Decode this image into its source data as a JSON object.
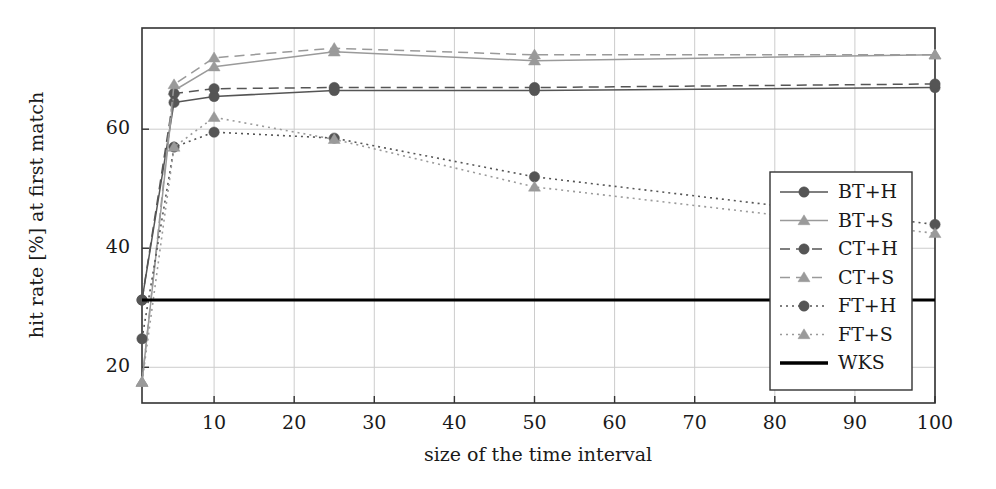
{
  "chart_data": {
    "type": "line",
    "title": "",
    "xlabel": "size of the time interval",
    "ylabel": "hit rate [%] at first match",
    "xlim": [
      1,
      100
    ],
    "ylim": [
      14,
      77
    ],
    "xticks": [
      10,
      20,
      30,
      40,
      50,
      60,
      70,
      80,
      90,
      100
    ],
    "yticks": [
      20,
      40,
      60
    ],
    "grid": true,
    "legend_position": "right-inside-bottom",
    "x": [
      1,
      5,
      10,
      25,
      50,
      100
    ],
    "series": [
      {
        "name": "BT+H",
        "marker": "circle",
        "line": "solid",
        "color": "#555555",
        "values": [
          31.3,
          64.5,
          65.5,
          66.5,
          66.5,
          67.0
        ]
      },
      {
        "name": "BT+S",
        "marker": "triangle",
        "line": "solid",
        "color": "#9a9a9a",
        "values": [
          17.5,
          66.5,
          70.5,
          73.0,
          71.5,
          72.5
        ]
      },
      {
        "name": "CT+H",
        "marker": "circle",
        "line": "dashed",
        "color": "#555555",
        "values": [
          31.3,
          66.0,
          66.8,
          67.0,
          67.0,
          67.6
        ]
      },
      {
        "name": "CT+S",
        "marker": "triangle",
        "line": "dashed",
        "color": "#9a9a9a",
        "values": [
          17.5,
          67.5,
          72.0,
          73.6,
          72.5,
          72.5
        ]
      },
      {
        "name": "FT+H",
        "marker": "circle",
        "line": "dotted",
        "color": "#555555",
        "values": [
          24.8,
          57.0,
          59.5,
          58.5,
          52.0,
          44.0
        ]
      },
      {
        "name": "FT+S",
        "marker": "triangle",
        "line": "dotted",
        "color": "#9a9a9a",
        "values": [
          17.5,
          57.0,
          62.0,
          58.3,
          50.3,
          42.5
        ]
      },
      {
        "name": "WKS",
        "marker": "none",
        "line": "thick-solid",
        "color": "#000000",
        "constant": 31.3,
        "values": [
          31.3,
          31.3,
          31.3,
          31.3,
          31.3,
          31.3
        ]
      }
    ]
  },
  "legend": {
    "items": [
      {
        "label": "BT+H"
      },
      {
        "label": "BT+S"
      },
      {
        "label": "CT+H"
      },
      {
        "label": "CT+S"
      },
      {
        "label": "FT+H"
      },
      {
        "label": "FT+S"
      },
      {
        "label": "WKS"
      }
    ]
  },
  "axes": {
    "ylabel": "hit rate [%] at first match",
    "xlabel": "size of the time interval",
    "ytick_labels": [
      "20",
      "40",
      "60"
    ],
    "xtick_labels": [
      "10",
      "20",
      "30",
      "40",
      "50",
      "60",
      "70",
      "80",
      "90",
      "100"
    ]
  },
  "colors": {
    "dark_series": "#555555",
    "light_series": "#9a9a9a",
    "baseline": "#000000",
    "grid": "#cccccc",
    "frame": "#333333",
    "background": "#ffffff"
  }
}
